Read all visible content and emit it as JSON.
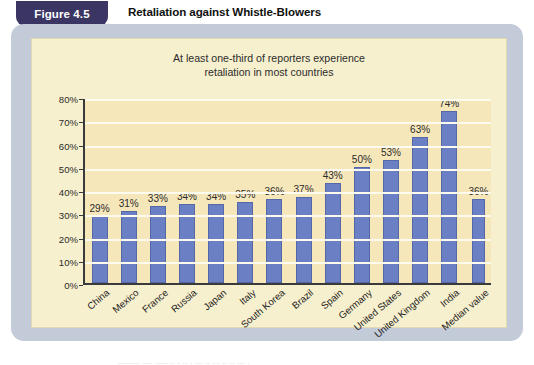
{
  "figure": {
    "tag_label": "Figure 4.5",
    "heading": "Retaliation against Whistle-Blowers"
  },
  "colors": {
    "tag_background": "#3b3564",
    "panel_background": "#c3cad8",
    "chart_background": "#f6e7bb",
    "bar_color": "#6b80c4",
    "gridline_color": "#fdfaf0",
    "axis_color": "#3a3a3a"
  },
  "chart_data": {
    "type": "bar",
    "title": "At least one-third of reporters experience retaliation in most countries",
    "title_line_1": "At least one-third of reporters experience",
    "title_line_2": "retaliation in most countries",
    "xlabel": "",
    "ylabel": "",
    "ylim": [
      0,
      80
    ],
    "ytick_labels": [
      "0%",
      "10%",
      "20%",
      "30%",
      "40%",
      "50%",
      "60%",
      "70%",
      "80%"
    ],
    "ytick_values": [
      0,
      10,
      20,
      30,
      40,
      50,
      60,
      70,
      80
    ],
    "grid": true,
    "legend": "none",
    "categories": [
      "China",
      "Mexico",
      "France",
      "Russia",
      "Japan",
      "Italy",
      "South Korea",
      "Brazil",
      "Spain",
      "Germany",
      "United States",
      "United Kingdom",
      "India",
      "Median value"
    ],
    "values": [
      29,
      31,
      33,
      34,
      34,
      35,
      36,
      37,
      43,
      50,
      53,
      63,
      74,
      36
    ],
    "value_labels": [
      "29%",
      "31%",
      "33%",
      "34%",
      "34%",
      "35%",
      "36%",
      "37%",
      "43%",
      "50%",
      "53%",
      "63%",
      "74%",
      "36%"
    ]
  },
  "footer": {
    "cropped_text": "......... ....  .....  .. .  ..   . ... .. .  .  ..    .. ... ."
  }
}
